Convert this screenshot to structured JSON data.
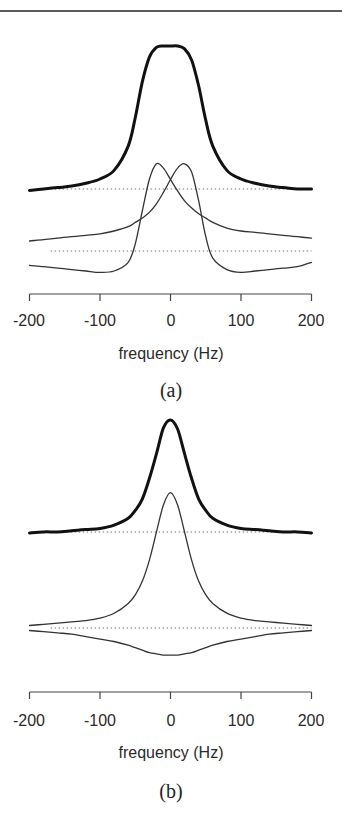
{
  "figure": {
    "panels": [
      {
        "label": "(a)",
        "xlabel": "frequency (Hz)",
        "ticks": [
          "-200",
          "-100",
          "0",
          "100",
          "200"
        ]
      },
      {
        "label": "(b)",
        "xlabel": "frequency (Hz)",
        "ticks": [
          "-200",
          "-100",
          "0",
          "100",
          "200"
        ]
      }
    ]
  },
  "chart_data": [
    {
      "type": "line",
      "title": "(a)",
      "xlabel": "frequency (Hz)",
      "ylabel": "",
      "xlim": [
        -200,
        200
      ],
      "xticks": [
        -200,
        -100,
        0,
        100,
        200
      ],
      "grid": false,
      "legend": null,
      "baselines": [
        {
          "name": "upper baseline",
          "style": "dotted",
          "y": 0
        },
        {
          "name": "lower baseline",
          "style": "dotted",
          "y": 0
        }
      ],
      "x": [
        -200,
        -180,
        -160,
        -140,
        -120,
        -100,
        -80,
        -60,
        -50,
        -40,
        -30,
        -20,
        -10,
        0,
        10,
        20,
        30,
        40,
        50,
        60,
        80,
        100,
        120,
        140,
        160,
        180,
        200
      ],
      "series": [
        {
          "name": "total spectrum (thick, upper trace)",
          "offset": "upper baseline",
          "values": [
            -0.01,
            0.0,
            0.01,
            0.02,
            0.04,
            0.07,
            0.13,
            0.3,
            0.5,
            0.75,
            0.92,
            0.99,
            1.0,
            1.0,
            1.0,
            0.98,
            0.9,
            0.72,
            0.48,
            0.3,
            0.13,
            0.07,
            0.04,
            0.02,
            0.01,
            0.0,
            0.0
          ]
        },
        {
          "name": "component peaked at -20 Hz (thin, lower trace)",
          "offset": "lower baseline",
          "values": [
            -0.1,
            -0.11,
            -0.12,
            -0.13,
            -0.14,
            -0.15,
            -0.14,
            -0.08,
            0.05,
            0.28,
            0.5,
            0.61,
            0.58,
            0.5,
            0.42,
            0.35,
            0.3,
            0.26,
            0.23,
            0.2,
            0.16,
            0.14,
            0.13,
            0.12,
            0.11,
            0.1,
            0.09
          ]
        },
        {
          "name": "component peaked at +15 Hz (thin, lower trace)",
          "offset": "lower baseline",
          "values": [
            0.07,
            0.08,
            0.09,
            0.1,
            0.11,
            0.12,
            0.14,
            0.17,
            0.2,
            0.23,
            0.27,
            0.33,
            0.41,
            0.5,
            0.58,
            0.61,
            0.55,
            0.35,
            0.1,
            -0.05,
            -0.13,
            -0.15,
            -0.14,
            -0.13,
            -0.12,
            -0.11,
            -0.08
          ]
        }
      ]
    },
    {
      "type": "line",
      "title": "(b)",
      "xlabel": "frequency (Hz)",
      "ylabel": "",
      "xlim": [
        -200,
        200
      ],
      "xticks": [
        -200,
        -100,
        0,
        100,
        200
      ],
      "grid": false,
      "legend": null,
      "baselines": [
        {
          "name": "upper baseline",
          "style": "dotted",
          "y": 0
        },
        {
          "name": "lower baseline",
          "style": "dotted",
          "y": 0
        }
      ],
      "x": [
        -200,
        -180,
        -160,
        -140,
        -120,
        -100,
        -80,
        -60,
        -50,
        -40,
        -30,
        -20,
        -10,
        0,
        10,
        20,
        30,
        40,
        50,
        60,
        80,
        100,
        120,
        140,
        160,
        180,
        200
      ],
      "series": [
        {
          "name": "total spectrum (thick, upper trace)",
          "offset": "upper baseline",
          "values": [
            0.0,
            0.01,
            0.01,
            0.02,
            0.03,
            0.04,
            0.07,
            0.13,
            0.2,
            0.3,
            0.48,
            0.7,
            0.93,
            1.0,
            0.92,
            0.7,
            0.48,
            0.3,
            0.2,
            0.13,
            0.07,
            0.04,
            0.03,
            0.02,
            0.01,
            0.01,
            0.0
          ]
        },
        {
          "name": "absorptive component (thin, positive)",
          "offset": "lower baseline",
          "values": [
            0.02,
            0.03,
            0.04,
            0.05,
            0.06,
            0.08,
            0.12,
            0.2,
            0.27,
            0.38,
            0.55,
            0.78,
            1.0,
            1.1,
            1.0,
            0.78,
            0.55,
            0.38,
            0.27,
            0.2,
            0.12,
            0.08,
            0.06,
            0.05,
            0.04,
            0.03,
            0.02
          ]
        },
        {
          "name": "negative component (thin)",
          "offset": "lower baseline",
          "values": [
            -0.02,
            -0.03,
            -0.04,
            -0.05,
            -0.07,
            -0.09,
            -0.11,
            -0.14,
            -0.16,
            -0.18,
            -0.2,
            -0.21,
            -0.22,
            -0.22,
            -0.22,
            -0.21,
            -0.2,
            -0.18,
            -0.16,
            -0.14,
            -0.11,
            -0.09,
            -0.07,
            -0.05,
            -0.04,
            -0.03,
            -0.02
          ]
        }
      ]
    }
  ]
}
